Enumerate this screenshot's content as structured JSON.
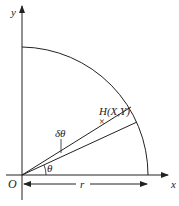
{
  "diagram": {
    "axes": {
      "x_label": "x",
      "y_label": "y",
      "origin_label": "O"
    },
    "point": {
      "label": "H(X,Y)",
      "marker": "×"
    },
    "angles": {
      "theta_label": "θ",
      "delta_theta_label": "δθ"
    },
    "radius": {
      "label": "r"
    },
    "colors": {
      "stroke": "#222222",
      "background": "#ffffff"
    }
  }
}
